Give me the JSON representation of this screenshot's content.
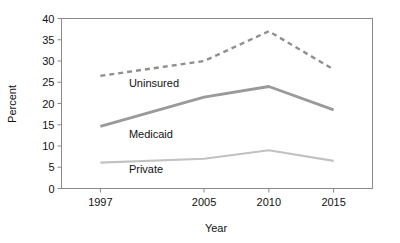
{
  "chart_data": {
    "type": "line",
    "title": "",
    "xlabel": "Year",
    "ylabel": "Percent",
    "categories": [
      1997,
      2005,
      2010,
      2015
    ],
    "xtick_labels": [
      "1997",
      "2005",
      "2010",
      "2015"
    ],
    "ytick_labels": [
      "0",
      "5",
      "10",
      "15",
      "20",
      "25",
      "30",
      "35",
      "40"
    ],
    "ytick_values": [
      0,
      5,
      10,
      15,
      20,
      25,
      30,
      35,
      40
    ],
    "ylim": [
      0,
      40
    ],
    "xlim": [
      1994,
      2018
    ],
    "grid": false,
    "legend": "inline-labels",
    "series": [
      {
        "name": "Uninsured",
        "values": [
          26.5,
          30.0,
          37.0,
          28.0
        ],
        "style": "dashed",
        "color": "#8f8f8f",
        "width": 2.4,
        "label_x": 1999.2,
        "label_y": 24.0
      },
      {
        "name": "Medicaid",
        "values": [
          14.6,
          21.5,
          24.0,
          18.5
        ],
        "style": "solid",
        "color": "#9a9a9a",
        "width": 2.8,
        "label_x": 1999.2,
        "label_y": 12.0
      },
      {
        "name": "Private",
        "values": [
          6.1,
          7.0,
          9.0,
          6.5
        ],
        "style": "solid",
        "color": "#c2c2c2",
        "width": 2.2,
        "label_x": 1999.2,
        "label_y": 3.6
      }
    ]
  },
  "axes": {
    "x_title": "Year",
    "y_title": "Percent"
  },
  "colors": {
    "border": "#8a8a8a",
    "background": "#ffffff",
    "text": "#111111",
    "uninsured": "#8f8f8f",
    "medicaid": "#9a9a9a",
    "private": "#c2c2c2"
  }
}
